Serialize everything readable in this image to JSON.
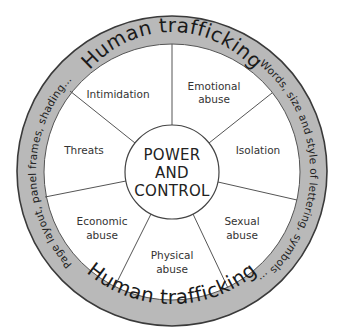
{
  "diagram": {
    "type": "power-and-control-wheel",
    "center": {
      "lines": [
        "POWER",
        "AND",
        "CONTROL"
      ]
    },
    "ring": {
      "top_title": "Human trafficking",
      "bottom_title": "Human trafficking",
      "left_text": "Page layout, panel frames, shading...",
      "right_text": "Words, size and style of lettering, symbols ...",
      "fill_color": "#b9b9b9",
      "border_color": "#3a3a3a"
    },
    "segments": [
      {
        "id": "intimidation",
        "lines": [
          "Intimidation"
        ]
      },
      {
        "id": "emotional-abuse",
        "lines": [
          "Emotional",
          "abuse"
        ]
      },
      {
        "id": "isolation",
        "lines": [
          "Isolation"
        ]
      },
      {
        "id": "sexual-abuse",
        "lines": [
          "Sexual",
          "abuse"
        ]
      },
      {
        "id": "physical-abuse",
        "lines": [
          "Physical",
          "abuse"
        ]
      },
      {
        "id": "economic-abuse",
        "lines": [
          "Economic",
          "abuse"
        ]
      },
      {
        "id": "threats",
        "lines": [
          "Threats"
        ]
      }
    ]
  }
}
